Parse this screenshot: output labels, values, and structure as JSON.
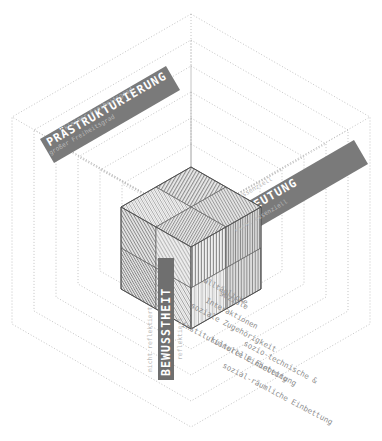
{
  "diagram": {
    "background_color": "#ffffff",
    "axis_bar_color": "#787878",
    "axis_bar_color_dark": "#6a6a6a",
    "dotted_line_color": "#b5b5b5",
    "cube_outline_color": "#555555",
    "tick_label_color": "#b9b9b9",
    "layer_label_color": "#8d8d8d"
  },
  "axes": [
    {
      "id": "praestrukturierung",
      "label": "PRÄSTRUKTURIERUNG",
      "position": "upper-left",
      "ticks": [
        {
          "label": "kleiner Freiheitsgrad",
          "position": "outer"
        },
        {
          "label": "großer Freiheitsgrad",
          "position": "inner"
        }
      ]
    },
    {
      "id": "bedeutung",
      "label": "BEDEUTUNG",
      "position": "upper-right",
      "ticks": [
        {
          "label": "essenziell",
          "position": "inner"
        },
        {
          "label": "nicht essenziell",
          "position": "outer"
        }
      ]
    },
    {
      "id": "bewusstheit",
      "label": "BEWUSSTHEIT",
      "position": "vertical-center",
      "ticks": [
        {
          "label": "nicht reflektiert",
          "position": "left"
        },
        {
          "label": "reflektiert",
          "position": "right"
        }
      ]
    }
  ],
  "layers": [
    {
      "index": 1,
      "label": "alltägliche",
      "label2": "soziale",
      "label3": "Interaktionen"
    },
    {
      "index": 2,
      "label": "soziale Zugehörigkeit"
    },
    {
      "index": 3,
      "label": "institutionelle Einbettung"
    },
    {
      "index": 4,
      "label": "kulturelle Einbettung"
    },
    {
      "index": 5,
      "label": "sozio-technische &"
    },
    {
      "index": 6,
      "label": "sozial-räumliche Einbettung"
    }
  ],
  "cube": {
    "description": "Zentraler Wuerfel in isometrischer Projektion, jede sichtbare Flaeche in vier Quadranten mit Streifenmuster geteilt",
    "faces": [
      {
        "name": "top",
        "quadrants": 4,
        "pattern": "stripes"
      },
      {
        "name": "left",
        "quadrants": 4,
        "pattern": "stripes"
      },
      {
        "name": "right",
        "quadrants": 4,
        "pattern": "stripes"
      }
    ]
  }
}
